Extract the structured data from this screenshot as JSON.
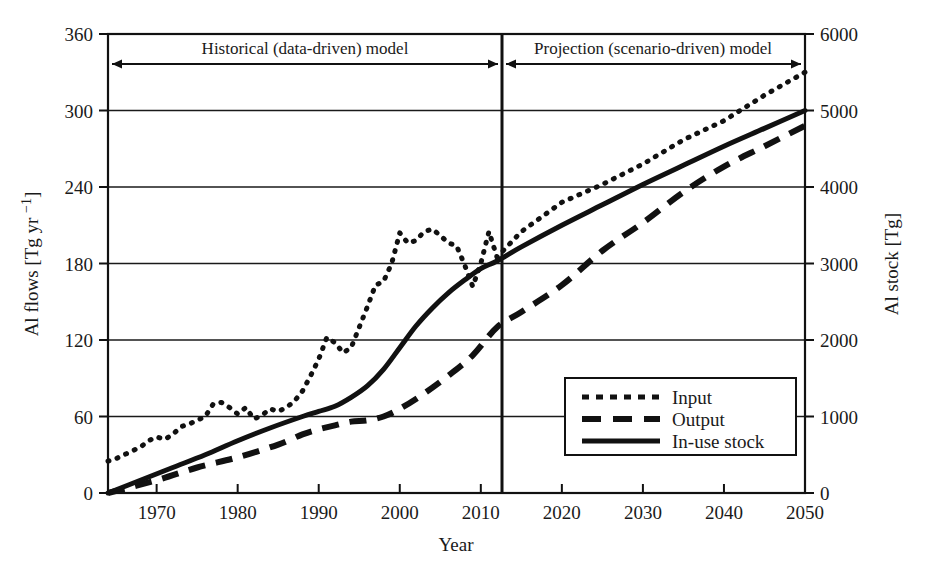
{
  "chart_data": {
    "type": "line",
    "title": "",
    "xlabel": "Year",
    "ylabel": "Al flows [Tg yr −1]",
    "ylabel_secondary": "Al stock [Tg]",
    "xlim": [
      1964,
      2050
    ],
    "ylim": [
      0,
      360
    ],
    "ylim_secondary": [
      0,
      6000
    ],
    "grid": "horizontal",
    "legend_position": "lower-right-inside",
    "x_ticks": [
      "1970",
      "1980",
      "1990",
      "2000",
      "2010",
      "2020",
      "2030",
      "2040",
      "2050"
    ],
    "x_tick_values": [
      1970,
      1980,
      1990,
      2000,
      2010,
      2020,
      2030,
      2040,
      2050
    ],
    "y_ticks": [
      "0",
      "60",
      "120",
      "180",
      "240",
      "300",
      "360"
    ],
    "y_tick_values": [
      0,
      60,
      120,
      180,
      240,
      300,
      360
    ],
    "y2_ticks": [
      "0",
      "1000",
      "2000",
      "3000",
      "4000",
      "5000",
      "6000"
    ],
    "y2_tick_values": [
      0,
      1000,
      2000,
      3000,
      4000,
      5000,
      6000
    ],
    "series": [
      {
        "name": "Input",
        "axis": "left",
        "style": "dotted",
        "x": [
          1964,
          1965,
          1966,
          1967,
          1968,
          1969,
          1970,
          1971,
          1972,
          1973,
          1974,
          1975,
          1976,
          1977,
          1978,
          1979,
          1980,
          1981,
          1982,
          1983,
          1984,
          1985,
          1986,
          1987,
          1988,
          1989,
          1990,
          1991,
          1992,
          1993,
          1994,
          1995,
          1996,
          1997,
          1998,
          1999,
          2000,
          2001,
          2002,
          2003,
          2004,
          2005,
          2006,
          2007,
          2008,
          2009,
          2010,
          2011,
          2012,
          2015,
          2020,
          2025,
          2030,
          2035,
          2040,
          2045,
          2050
        ],
        "values": [
          25,
          27,
          30,
          33,
          36,
          41,
          44,
          42,
          46,
          52,
          54,
          57,
          60,
          70,
          71,
          67,
          62,
          67,
          58,
          61,
          66,
          64,
          67,
          72,
          80,
          92,
          105,
          122,
          118,
          110,
          114,
          130,
          146,
          163,
          166,
          180,
          204,
          196,
          198,
          205,
          207,
          202,
          196,
          194,
          179,
          162,
          180,
          205,
          185,
          205,
          228,
          242,
          258,
          277,
          292,
          312,
          330
        ]
      },
      {
        "name": "Output",
        "axis": "left",
        "style": "dashed",
        "x": [
          1964,
          1970,
          1975,
          1980,
          1985,
          1988,
          1990,
          1992,
          1994,
          1996,
          1998,
          2000,
          2003,
          2006,
          2009,
          2012,
          2015,
          2020,
          2025,
          2030,
          2035,
          2040,
          2045,
          2050
        ],
        "values": [
          0,
          10,
          20,
          28,
          38,
          46,
          50,
          53,
          56,
          57,
          60,
          66,
          78,
          92,
          108,
          130,
          142,
          163,
          190,
          212,
          236,
          256,
          272,
          288
        ]
      },
      {
        "name": "In-use stock",
        "axis": "right",
        "style": "solid",
        "x": [
          1964,
          1968,
          1972,
          1976,
          1980,
          1984,
          1988,
          1990,
          1992,
          1994,
          1996,
          1998,
          2000,
          2002,
          2004,
          2006,
          2008,
          2010,
          2012,
          2015,
          2020,
          2025,
          2030,
          2035,
          2040,
          2045,
          2050
        ],
        "values": [
          0,
          170,
          330,
          500,
          680,
          850,
          1000,
          1060,
          1140,
          1250,
          1400,
          1620,
          1900,
          2180,
          2420,
          2620,
          2790,
          2930,
          3040,
          3220,
          3500,
          3770,
          4030,
          4280,
          4530,
          4770,
          5000
        ],
        "values_left_axis": [
          0,
          10,
          20,
          30,
          41,
          51,
          60,
          64,
          68,
          75,
          84,
          97,
          114,
          131,
          145,
          157,
          167,
          176,
          182,
          193,
          210,
          226,
          242,
          257,
          272,
          286,
          300
        ]
      }
    ],
    "annotations": [
      {
        "label": "Historical (data-driven) model",
        "from": 1964,
        "to": 2012
      },
      {
        "label": "Projection (scenario-driven) model",
        "from": 2012,
        "to": 2050
      }
    ],
    "divider_year": 2012,
    "colors": {
      "line": "#111111",
      "grid": "#1a1a1a",
      "background": "#ffffff"
    }
  },
  "legend": {
    "entries": [
      {
        "label": "Input",
        "style": "dotted"
      },
      {
        "label": "Output",
        "style": "dashed"
      },
      {
        "label": "In-use stock",
        "style": "solid"
      }
    ]
  }
}
